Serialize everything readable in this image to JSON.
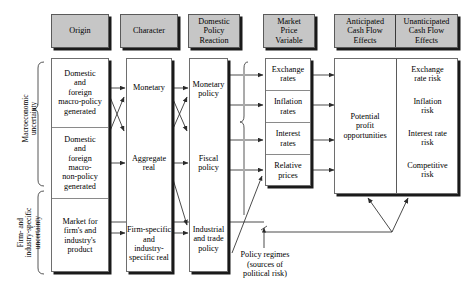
{
  "figure": {
    "type": "flow-diagram"
  },
  "headers": {
    "origin": "Origin",
    "character": "Character",
    "domestic_policy_reaction": "Domestic\nPolicy\nReaction",
    "market_price_variable": "Market\nPrice\nVariable",
    "anticipated": "Anticipated\nCash Flow\nEffects",
    "unanticipated": "Unanticipated\nCash Flow\nEffects"
  },
  "side_labels": {
    "macro": "Macroeconomic\nuncertainty",
    "firm": "Firm- and\nindustry-specific\nuncertainty"
  },
  "columns": {
    "origin": [
      "Domestic\nand\nforeign\nmacro-policy\ngenerated",
      "Domestic\nand\nforeign\nmacro-\nnon-policy\ngenerated",
      "Market for\nfirm's and\nindustry's\nproduct"
    ],
    "character": [
      "Monetary",
      "Aggregate\nreal",
      "Firm-specific\nand\nindustry-\nspecific real"
    ],
    "domestic_policy_reaction": [
      "Monetary\npolicy",
      "Fiscal\npolicy",
      "Industrial\nand trade\npolicy"
    ],
    "market_price_variable": [
      "Exchange\nrates",
      "Inflation\nrates",
      "Interest\nrates",
      "Relative\nprices"
    ],
    "anticipated": [
      "Potential\nprofit\nopportunities"
    ],
    "unanticipated": [
      "Exchange\nrate risk",
      "Inflation\nrisk",
      "Interest rate\nrisk",
      "Competitive\nrisk"
    ]
  },
  "annotations": {
    "policy_regimes": "Policy regimes\n(sources of\npolitical risk)"
  },
  "colors": {
    "header_fill": "#c6c6c6",
    "header_border": "#5a5a5a",
    "box_fill": "#ffffff",
    "box_border": "#6e6e6e",
    "shadow": "#1a1a1a",
    "line": "#3a3a3a",
    "text": "#000000",
    "background": "#ffffff"
  }
}
